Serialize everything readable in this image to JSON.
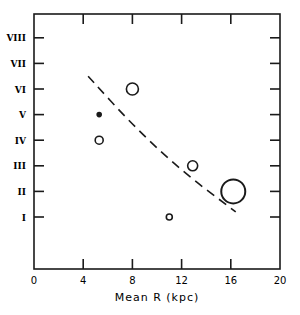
{
  "chart_data": {
    "type": "scatter",
    "title": "",
    "xlabel": "Mean R (kpc)",
    "ylabel": "",
    "xlim": [
      0,
      20
    ],
    "ylim": [
      0,
      9
    ],
    "x_ticks": [
      0,
      4,
      8,
      12,
      16,
      20
    ],
    "x_tick_labels": [
      "0",
      "4",
      "8",
      "12",
      "16",
      "20"
    ],
    "y_ticks": [
      1,
      2,
      3,
      4,
      5,
      6,
      7,
      8
    ],
    "y_tick_labels": [
      "I",
      "II",
      "III",
      "IV",
      "V",
      "VI",
      "VII",
      "VIII"
    ],
    "grid": false,
    "legend": null,
    "series": [
      {
        "name": "points",
        "marker": "open-circle (size varies)",
        "points": [
          {
            "x": 5.3,
            "y": 5,
            "size": "dot",
            "filled": true
          },
          {
            "x": 5.3,
            "y": 4,
            "size": "small",
            "filled": false
          },
          {
            "x": 8.0,
            "y": 6,
            "size": "medium",
            "filled": false
          },
          {
            "x": 12.9,
            "y": 3,
            "size": "small-medium",
            "filled": false
          },
          {
            "x": 11.0,
            "y": 1,
            "size": "tiny",
            "filled": false
          },
          {
            "x": 16.2,
            "y": 2,
            "size": "large",
            "filled": false
          }
        ]
      },
      {
        "name": "trend",
        "style": "dashed",
        "points": [
          {
            "x": 4.4,
            "y": 6.5
          },
          {
            "x": 8.0,
            "y": 4.6
          },
          {
            "x": 12.0,
            "y": 2.8
          },
          {
            "x": 16.4,
            "y": 1.2
          }
        ]
      }
    ]
  }
}
